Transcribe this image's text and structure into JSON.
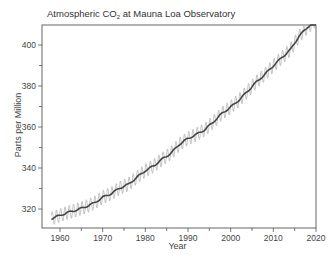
{
  "chart_data": {
    "type": "line",
    "title": "Atmospheric CO2 at Mauna Loa Observatory",
    "title_main": "Atmospheric CO",
    "title_sub": "2",
    "title_rest": " at Mauna Loa Observatory",
    "xlabel": "Year",
    "ylabel": "Parts per Million",
    "xlim": [
      1956,
      2020
    ],
    "ylim": [
      310,
      410
    ],
    "x_ticks": [
      1960,
      1970,
      1980,
      1990,
      2000,
      2010,
      2020
    ],
    "x_minor_ticks": [
      1965,
      1975,
      1985,
      1995,
      2005,
      2015
    ],
    "y_ticks": [
      320,
      340,
      360,
      380,
      400
    ],
    "y_minor_ticks": [
      330,
      350,
      370,
      390
    ],
    "grid": false,
    "legend": null,
    "series": [
      {
        "name": "Annual trend",
        "color": "#444444",
        "x": [
          1958,
          1960,
          1962,
          1964,
          1966,
          1968,
          1970,
          1972,
          1974,
          1976,
          1978,
          1980,
          1982,
          1984,
          1986,
          1988,
          1990,
          1992,
          1994,
          1996,
          1998,
          2000,
          2002,
          2004,
          2006,
          2008,
          2010,
          2012,
          2014,
          2016,
          2018,
          2020
        ],
        "values": [
          315.3,
          316.9,
          318.4,
          319.6,
          321.1,
          322.9,
          325.7,
          327.5,
          330.2,
          332.0,
          335.4,
          338.7,
          341.1,
          344.4,
          347.2,
          351.6,
          354.4,
          356.4,
          358.8,
          362.6,
          366.7,
          369.7,
          373.2,
          377.5,
          381.9,
          385.6,
          389.9,
          393.9,
          397.7,
          404.2,
          408.7,
          412.0
        ]
      },
      {
        "name": "Monthly (seasonal cycle)",
        "color": "#aaaaaa",
        "seasonal_amplitude_ppm": 3.3
      }
    ]
  }
}
